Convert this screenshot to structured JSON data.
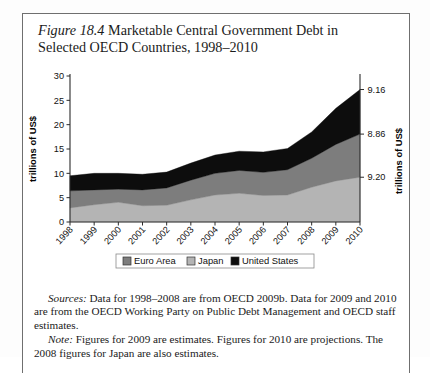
{
  "figure": {
    "number": "Figure 18.4",
    "title_rest": " Marketable Central Government Debt in Selected OECD Countries, 1998–2010"
  },
  "chart_data": {
    "type": "area",
    "stacked": true,
    "title": "Marketable Central Government Debt in Selected OECD Countries, 1998–2010",
    "xlabel": "",
    "ylabel": "trillions of US$",
    "ylim": [
      0,
      30
    ],
    "yticks": [
      0,
      5,
      10,
      15,
      20,
      25,
      30
    ],
    "grid": false,
    "legend_position": "bottom",
    "categories": [
      "1998",
      "1999",
      "2000",
      "2001",
      "2002",
      "2003",
      "2004",
      "2005",
      "2006",
      "2007",
      "2008",
      "2009",
      "2010"
    ],
    "series": [
      {
        "name": "Japan",
        "color": "#b4b4b4",
        "values": [
          2.9,
          3.55,
          4.05,
          3.35,
          3.45,
          4.55,
          5.55,
          5.9,
          5.45,
          5.55,
          7.15,
          8.45,
          9.2
        ]
      },
      {
        "name": "Euro Area",
        "color": "#7d7d7d",
        "values": [
          3.5,
          3.05,
          2.7,
          3.25,
          3.55,
          4.05,
          4.45,
          4.7,
          4.75,
          5.2,
          5.95,
          7.5,
          8.86
        ]
      },
      {
        "name": "United States",
        "color": "#0d0d0d",
        "values": [
          3.1,
          3.4,
          3.25,
          3.2,
          3.25,
          3.5,
          3.75,
          3.95,
          4.2,
          4.35,
          5.4,
          7.4,
          9.16
        ]
      }
    ],
    "right_axis_labels": [
      {
        "text": "9.16",
        "series": "United States",
        "year": "2010"
      },
      {
        "text": "8.86",
        "series": "Euro Area",
        "year": "2010"
      },
      {
        "text": "9.20",
        "series": "Japan",
        "year": "2010"
      }
    ],
    "legend": [
      {
        "label": "Euro Area",
        "color": "#7d7d7d"
      },
      {
        "label": "Japan",
        "color": "#b4b4b4"
      },
      {
        "label": "United States",
        "color": "#0d0d0d"
      }
    ]
  },
  "footnotes": {
    "sources_label": "Sources:",
    "sources_text": " Data for 1998–2008 are from OECD 2009b. Data for 2009 and 2010 are from the OECD Working Party on Public Debt Management and OECD staff estimates.",
    "note_label": "Note:",
    "note_text": " Figures for 2009 are estimates. Figures for 2010 are projections. The 2008 figures for Japan are also estimates."
  }
}
